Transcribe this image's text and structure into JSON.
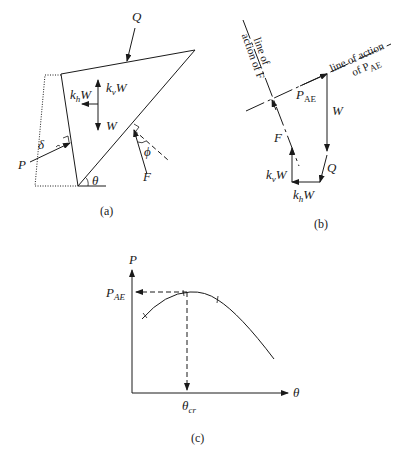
{
  "figure": {
    "panel_a": {
      "caption": "(a)",
      "labels": {
        "Q": "Q",
        "kv": "k",
        "kv_sub": "v",
        "kv_W": "W",
        "kh": "k",
        "kh_sub": "h",
        "kh_W": "W",
        "W": "W",
        "P": "P",
        "delta": "δ",
        "theta": "θ",
        "phi": "ϕ",
        "F": "F"
      }
    },
    "panel_b": {
      "caption": "(b)",
      "labels": {
        "line_F_1": "line of",
        "line_F_2": "action of F",
        "line_P_1": "line of action",
        "line_P_2": "of P",
        "line_P_2_sub": "AE",
        "PAE": "P",
        "PAE_sub": "AE",
        "W": "W",
        "F": "F",
        "Q": "Q",
        "kv": "k",
        "kv_sub": "v",
        "kv_W": "W",
        "kh": "k",
        "kh_sub": "h",
        "kh_W": "W"
      }
    },
    "panel_c": {
      "caption": "(c)",
      "labels": {
        "y_axis": "P",
        "x_axis": "θ",
        "PAE": "P",
        "PAE_sub": "AE",
        "theta_cr": "θ",
        "theta_cr_sub": "cr"
      }
    }
  },
  "colors": {
    "ink": "#1a1a1a",
    "background": "#ffffff"
  }
}
